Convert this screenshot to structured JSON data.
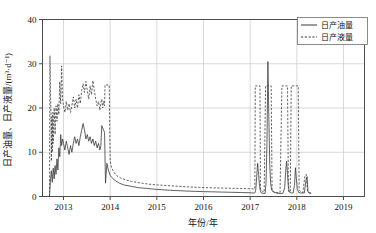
{
  "chart_data": {
    "type": "line",
    "title": "",
    "xlabel": "年份/年",
    "ylabel": "日产油量、日产液量/(m³·d⁻¹)",
    "xlim": [
      2012.55,
      2019.45
    ],
    "ylim": [
      0,
      40
    ],
    "xticks": [
      2013,
      2014,
      2015,
      2016,
      2017,
      2018,
      2019
    ],
    "xticklabels": [
      "2013",
      "2014",
      "2015",
      "2016",
      "2017",
      "2018",
      "2019"
    ],
    "yticks": [
      0,
      10,
      20,
      30,
      40
    ],
    "yticklabels": [
      "0",
      "10",
      "20",
      "30",
      "40"
    ],
    "grid": true,
    "legend_position": "top-right",
    "series": [
      {
        "name": "日产油量",
        "style": "solid",
        "color": "#3a3a3a",
        "points": [
          [
            2012.7,
            0.0
          ],
          [
            2012.72,
            3.5
          ],
          [
            2012.74,
            5.8
          ],
          [
            2012.76,
            3.2
          ],
          [
            2012.78,
            6.4
          ],
          [
            2012.8,
            4.0
          ],
          [
            2012.82,
            7.0
          ],
          [
            2012.84,
            5.0
          ],
          [
            2012.86,
            8.5
          ],
          [
            2012.88,
            6.0
          ],
          [
            2012.9,
            11.0
          ],
          [
            2012.92,
            9.0
          ],
          [
            2012.94,
            14.0
          ],
          [
            2012.96,
            11.5
          ],
          [
            2012.98,
            13.0
          ],
          [
            2013.0,
            12.0
          ],
          [
            2013.03,
            10.5
          ],
          [
            2013.06,
            12.5
          ],
          [
            2013.09,
            11.0
          ],
          [
            2013.12,
            9.5
          ],
          [
            2013.15,
            11.5
          ],
          [
            2013.18,
            10.0
          ],
          [
            2013.21,
            12.0
          ],
          [
            2013.24,
            13.5
          ],
          [
            2013.27,
            12.0
          ],
          [
            2013.3,
            13.0
          ],
          [
            2013.33,
            11.5
          ],
          [
            2013.36,
            13.5
          ],
          [
            2013.39,
            15.0
          ],
          [
            2013.42,
            16.5
          ],
          [
            2013.45,
            15.0
          ],
          [
            2013.48,
            13.0
          ],
          [
            2013.51,
            14.0
          ],
          [
            2013.54,
            12.5
          ],
          [
            2013.57,
            13.5
          ],
          [
            2013.6,
            12.0
          ],
          [
            2013.63,
            13.0
          ],
          [
            2013.66,
            11.5
          ],
          [
            2013.69,
            12.5
          ],
          [
            2013.72,
            11.0
          ],
          [
            2013.75,
            12.0
          ],
          [
            2013.78,
            10.5
          ],
          [
            2013.8,
            11.5
          ],
          [
            2013.82,
            16.0
          ],
          [
            2013.84,
            15.5
          ],
          [
            2013.86,
            15.0
          ],
          [
            2013.88,
            14.5
          ],
          [
            2013.9,
            3.0
          ],
          [
            2013.93,
            7.5
          ],
          [
            2013.96,
            6.0
          ],
          [
            2014.0,
            4.8
          ],
          [
            2014.06,
            4.0
          ],
          [
            2014.12,
            3.5
          ],
          [
            2014.2,
            3.0
          ],
          [
            2014.3,
            2.6
          ],
          [
            2014.45,
            2.3
          ],
          [
            2014.6,
            2.0
          ],
          [
            2014.8,
            1.8
          ],
          [
            2015.0,
            1.6
          ],
          [
            2015.3,
            1.4
          ],
          [
            2015.6,
            1.25
          ],
          [
            2016.0,
            1.1
          ],
          [
            2016.4,
            1.0
          ],
          [
            2016.8,
            0.9
          ],
          [
            2017.0,
            0.85
          ],
          [
            2017.05,
            0.8
          ],
          [
            2017.1,
            0.8
          ],
          [
            2017.12,
            1.5
          ],
          [
            2017.14,
            4.5
          ],
          [
            2017.16,
            7.5
          ],
          [
            2017.18,
            5.0
          ],
          [
            2017.2,
            2.5
          ],
          [
            2017.22,
            1.2
          ],
          [
            2017.24,
            0.8
          ],
          [
            2017.28,
            0.7
          ],
          [
            2017.32,
            0.7
          ],
          [
            2017.34,
            3.0
          ],
          [
            2017.36,
            12.0
          ],
          [
            2017.38,
            30.5
          ],
          [
            2017.4,
            18.0
          ],
          [
            2017.42,
            7.0
          ],
          [
            2017.44,
            3.0
          ],
          [
            2017.46,
            1.5
          ],
          [
            2017.5,
            1.0
          ],
          [
            2017.56,
            0.8
          ],
          [
            2017.6,
            0.7
          ],
          [
            2017.64,
            0.7
          ],
          [
            2017.7,
            0.7
          ],
          [
            2017.74,
            2.0
          ],
          [
            2017.76,
            5.5
          ],
          [
            2017.78,
            8.0
          ],
          [
            2017.8,
            5.0
          ],
          [
            2017.82,
            2.2
          ],
          [
            2017.84,
            1.0
          ],
          [
            2017.88,
            0.8
          ],
          [
            2017.92,
            0.8
          ],
          [
            2017.95,
            2.5
          ],
          [
            2017.97,
            6.5
          ],
          [
            2017.99,
            4.0
          ],
          [
            2018.01,
            1.8
          ],
          [
            2018.04,
            0.9
          ],
          [
            2018.08,
            0.8
          ],
          [
            2018.12,
            0.8
          ],
          [
            2018.16,
            0.8
          ],
          [
            2018.2,
            4.0
          ],
          [
            2018.22,
            4.5
          ],
          [
            2018.24,
            1.0
          ],
          [
            2018.26,
            0.8
          ],
          [
            2018.3,
            0.7
          ]
        ]
      },
      {
        "name": "日产液量",
        "style": "dashed",
        "color": "#3a3a3a",
        "points": [
          [
            2012.7,
            0.0
          ],
          [
            2012.71,
            31.8
          ],
          [
            2012.72,
            24.0
          ],
          [
            2012.73,
            20.0
          ],
          [
            2012.74,
            8.0
          ],
          [
            2012.75,
            18.0
          ],
          [
            2012.76,
            10.0
          ],
          [
            2012.77,
            19.0
          ],
          [
            2012.78,
            12.0
          ],
          [
            2012.8,
            20.0
          ],
          [
            2012.82,
            14.0
          ],
          [
            2012.84,
            20.5
          ],
          [
            2012.86,
            17.0
          ],
          [
            2012.88,
            21.0
          ],
          [
            2012.9,
            18.5
          ],
          [
            2012.92,
            26.0
          ],
          [
            2012.94,
            21.0
          ],
          [
            2012.96,
            29.5
          ],
          [
            2012.98,
            22.0
          ],
          [
            2013.0,
            20.5
          ],
          [
            2013.03,
            19.0
          ],
          [
            2013.06,
            21.5
          ],
          [
            2013.09,
            19.5
          ],
          [
            2013.12,
            21.0
          ],
          [
            2013.15,
            19.0
          ],
          [
            2013.18,
            20.5
          ],
          [
            2013.21,
            22.5
          ],
          [
            2013.24,
            20.0
          ],
          [
            2013.27,
            22.0
          ],
          [
            2013.3,
            20.0
          ],
          [
            2013.33,
            23.0
          ],
          [
            2013.36,
            21.0
          ],
          [
            2013.39,
            24.0
          ],
          [
            2013.42,
            25.5
          ],
          [
            2013.45,
            23.5
          ],
          [
            2013.48,
            26.0
          ],
          [
            2013.51,
            24.0
          ],
          [
            2013.54,
            22.0
          ],
          [
            2013.57,
            25.0
          ],
          [
            2013.6,
            23.0
          ],
          [
            2013.63,
            26.2
          ],
          [
            2013.66,
            24.0
          ],
          [
            2013.69,
            22.0
          ],
          [
            2013.72,
            20.5
          ],
          [
            2013.75,
            21.5
          ],
          [
            2013.78,
            19.5
          ],
          [
            2013.8,
            21.0
          ],
          [
            2013.82,
            22.0
          ],
          [
            2013.84,
            20.0
          ],
          [
            2013.86,
            21.5
          ],
          [
            2013.88,
            20.5
          ],
          [
            2013.89,
            25.2
          ],
          [
            2013.95,
            25.2
          ],
          [
            2013.98,
            25.2
          ],
          [
            2014.0,
            8.0
          ],
          [
            2014.03,
            6.5
          ],
          [
            2014.08,
            5.5
          ],
          [
            2014.14,
            4.7
          ],
          [
            2014.22,
            4.2
          ],
          [
            2014.32,
            3.8
          ],
          [
            2014.46,
            3.4
          ],
          [
            2014.62,
            3.1
          ],
          [
            2014.82,
            2.8
          ],
          [
            2015.02,
            2.6
          ],
          [
            2015.32,
            2.4
          ],
          [
            2015.62,
            2.2
          ],
          [
            2016.02,
            2.0
          ],
          [
            2016.42,
            1.9
          ],
          [
            2016.82,
            1.8
          ],
          [
            2017.0,
            1.75
          ],
          [
            2017.08,
            1.7
          ],
          [
            2017.1,
            1.7
          ],
          [
            2017.11,
            25.0
          ],
          [
            2017.13,
            25.0
          ],
          [
            2017.15,
            25.0
          ],
          [
            2017.17,
            25.0
          ],
          [
            2017.19,
            25.0
          ],
          [
            2017.21,
            25.0
          ],
          [
            2017.22,
            1.5
          ],
          [
            2017.26,
            1.2
          ],
          [
            2017.3,
            1.0
          ],
          [
            2017.33,
            25.0
          ],
          [
            2017.36,
            25.0
          ],
          [
            2017.39,
            25.0
          ],
          [
            2017.42,
            25.0
          ],
          [
            2017.45,
            25.0
          ],
          [
            2017.47,
            1.2
          ],
          [
            2017.52,
            1.0
          ],
          [
            2017.58,
            0.9
          ],
          [
            2017.64,
            0.9
          ],
          [
            2017.68,
            25.0
          ],
          [
            2017.71,
            25.0
          ],
          [
            2017.74,
            25.0
          ],
          [
            2017.77,
            25.0
          ],
          [
            2017.8,
            25.0
          ],
          [
            2017.82,
            1.2
          ],
          [
            2017.86,
            1.0
          ],
          [
            2017.88,
            25.0
          ],
          [
            2017.91,
            25.0
          ],
          [
            2017.94,
            25.0
          ],
          [
            2017.97,
            25.0
          ],
          [
            2018.0,
            25.0
          ],
          [
            2018.03,
            25.0
          ],
          [
            2018.05,
            1.5
          ],
          [
            2018.09,
            1.0
          ],
          [
            2018.13,
            0.9
          ],
          [
            2018.17,
            4.5
          ],
          [
            2018.2,
            5.0
          ],
          [
            2018.23,
            1.2
          ],
          [
            2018.27,
            0.9
          ],
          [
            2018.3,
            0.8
          ]
        ]
      }
    ]
  },
  "legend": {
    "entries": [
      {
        "label": "日产油量",
        "icon": "solid-line-swatch"
      },
      {
        "label": "日产液量",
        "icon": "dashed-line-swatch"
      }
    ]
  },
  "colors": {
    "axis": "#4d4d4d",
    "grid": "#c9c9c9",
    "series": "#3a3a3a",
    "background": "#ffffff"
  }
}
